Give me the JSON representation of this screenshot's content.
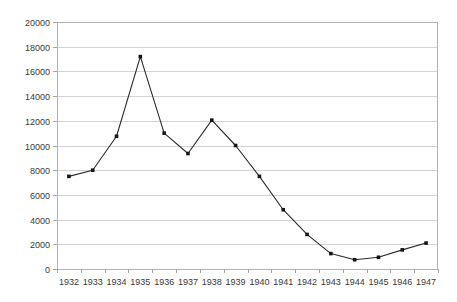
{
  "chart_data": {
    "type": "line",
    "title": "",
    "subtitle": "",
    "xlabel": "",
    "ylabel": "",
    "categories": [
      "1932",
      "1933",
      "1934",
      "1935",
      "1936",
      "1937",
      "1938",
      "1939",
      "1940",
      "1941",
      "1942",
      "1943",
      "1944",
      "1945",
      "1946",
      "1947"
    ],
    "values": [
      7500,
      8000,
      10750,
      17200,
      11000,
      9350,
      12050,
      10000,
      7500,
      4800,
      2800,
      1250,
      750,
      950,
      1550,
      2100
    ],
    "series": [
      {
        "name": "",
        "values": [
          7500,
          8000,
          10750,
          17200,
          11000,
          9350,
          12050,
          10000,
          7500,
          4800,
          2800,
          1250,
          750,
          950,
          1550,
          2100
        ]
      }
    ],
    "ylim": [
      0,
      20000
    ],
    "yticks": [
      0,
      2000,
      4000,
      6000,
      8000,
      10000,
      12000,
      14000,
      16000,
      18000,
      20000
    ],
    "ytick_labels": [
      "0",
      "2000",
      "4000",
      "6000",
      "8000",
      "10000",
      "12000",
      "14000",
      "16000",
      "18000",
      "20000"
    ],
    "xtick_labels": [
      "1932",
      "1933",
      "1934",
      "1935",
      "1936",
      "1937",
      "1938",
      "1939",
      "1940",
      "1941",
      "1942",
      "1943",
      "1944",
      "1945",
      "1946",
      "1947"
    ],
    "grid": true,
    "grid_axis": "y",
    "legend": false,
    "legend_position": "none",
    "markers": true,
    "marker_shape": "square",
    "annotations": [],
    "colors": {
      "line": "#2b2b2b",
      "marker": "#151515",
      "grid": "#c8c8c8",
      "frame": "#b4b4b4",
      "tick_text": "#3a3a3a",
      "background": "#ffffff"
    }
  },
  "layout": {
    "plot_left": 57,
    "plot_right": 438,
    "plot_top": 22,
    "plot_bottom": 269
  }
}
